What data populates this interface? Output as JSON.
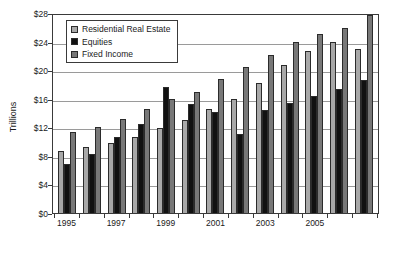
{
  "chart_data": {
    "type": "bar",
    "title": "",
    "xlabel": "",
    "ylabel": "Trillions",
    "ylim": [
      0,
      28
    ],
    "ytick_values": [
      0,
      4,
      8,
      12,
      16,
      20,
      24,
      28
    ],
    "ytick_labels": [
      "$0",
      "$4",
      "$8",
      "$12",
      "$16",
      "$20",
      "$24",
      "$28"
    ],
    "grid": true,
    "legend_position": "upper-left-inside",
    "categories": [
      "1995",
      "1996",
      "1997",
      "1998",
      "1999",
      "2000",
      "2001",
      "2002",
      "2003",
      "2004",
      "2005",
      "2006",
      "2007"
    ],
    "xtick_labels_shown": [
      "1995",
      "1997",
      "1999",
      "2001",
      "2003",
      "2005"
    ],
    "series": [
      {
        "name": "Residential Real Estate",
        "color": "#a8a8a8",
        "values": [
          8.7,
          9.2,
          9.8,
          10.7,
          11.9,
          13.0,
          14.5,
          16.0,
          18.2,
          20.7,
          22.7,
          24.0,
          22.9
        ]
      },
      {
        "name": "Equities",
        "color": "#111111",
        "values": [
          6.9,
          8.2,
          10.7,
          12.4,
          17.7,
          15.2,
          14.1,
          11.0,
          14.4,
          15.4,
          16.4,
          17.3,
          18.6
        ]
      },
      {
        "name": "Fixed Income",
        "color": "#787878",
        "values": [
          11.3,
          12.1,
          13.1,
          14.5,
          16.0,
          16.9,
          18.8,
          20.4,
          22.1,
          23.9,
          25.0,
          25.9,
          27.7
        ]
      }
    ]
  },
  "legend": {
    "items": [
      {
        "label": "Residential Real Estate"
      },
      {
        "label": "Equities"
      },
      {
        "label": "Fixed Income"
      }
    ]
  }
}
